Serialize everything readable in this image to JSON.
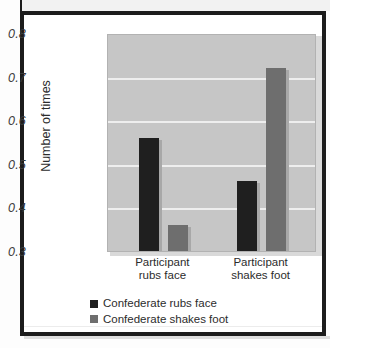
{
  "chart_data": {
    "type": "bar",
    "title": "",
    "xlabel": "",
    "ylabel": "Number of times",
    "ylim": [
      0.3,
      0.8
    ],
    "yticks": [
      "0.3",
      "0.4",
      "0.5",
      "0.6",
      "0.7",
      "0.8"
    ],
    "ytick_values": [
      0.3,
      0.4,
      0.5,
      0.6,
      0.7,
      0.8
    ],
    "grid": true,
    "legend_position": "bottom-left",
    "categories": [
      "Participant rubs face",
      "Participant shakes foot"
    ],
    "category_lines": [
      [
        "Participant",
        "rubs face"
      ],
      [
        "Participant",
        "shakes foot"
      ]
    ],
    "series": [
      {
        "name": "Confederate rubs face",
        "color": "#1f1f1f",
        "values": [
          0.56,
          0.46
        ]
      },
      {
        "name": "Confederate shakes foot",
        "color": "#6e6e6e",
        "values": [
          0.36,
          0.72
        ]
      }
    ],
    "plot_background": "#c6c6c6",
    "gridline_color": "#eeeeee"
  }
}
